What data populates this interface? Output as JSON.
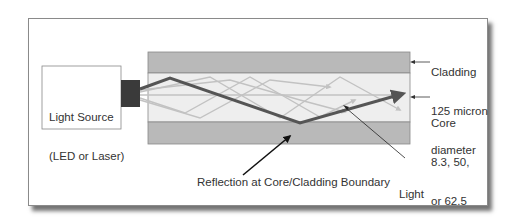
{
  "diagram": {
    "light_source": {
      "line1": "Light Source",
      "line2": "(LED or Laser)"
    },
    "cladding": {
      "line1": "Cladding",
      "line2": "125 micron",
      "line3": "diameter"
    },
    "core": {
      "line1": "Core",
      "line2": "8.3, 50,",
      "line3": "or 62.5",
      "line4": "micron",
      "line5": "diameter"
    },
    "reflection_label": "Reflection at Core/Cladding Boundary",
    "light_ray": {
      "line1": "Light",
      "line2": "Ray"
    },
    "colors": {
      "cladding": "#b9b9b9",
      "core": "#eeeeee",
      "main_ray": "#555555",
      "secondary_rays": "#c2c2c2",
      "emitter": "#3a3a3a",
      "frame_border": "#8a8a8a"
    }
  }
}
